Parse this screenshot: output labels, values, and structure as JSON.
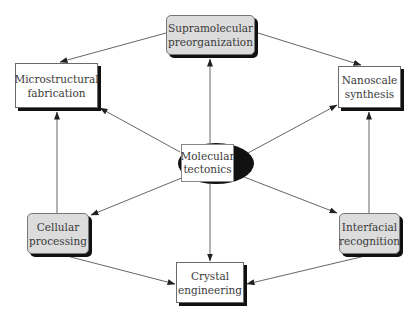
{
  "diagram": {
    "type": "concept-map",
    "center": {
      "id": "molecular-tectonics",
      "label": "Molecular\ntectonics",
      "style": "ellipse-black"
    },
    "nodes": [
      {
        "id": "supramolecular-preorganization",
        "label": "Supramolecular\npreorganization",
        "style": "shaded"
      },
      {
        "id": "microstructural-fabrication",
        "label": "Microstructural\nfabrication",
        "style": "plain"
      },
      {
        "id": "nanoscale-synthesis",
        "label": "Nanoscale\nsynthesis",
        "style": "plain"
      },
      {
        "id": "cellular-processing",
        "label": "Cellular\nprocessing",
        "style": "shaded"
      },
      {
        "id": "interfacial-recognition",
        "label": "Interfacial\nrecognition",
        "style": "shaded"
      },
      {
        "id": "crystal-engineering",
        "label": "Crystal\nengineering",
        "style": "plain"
      }
    ],
    "edges": [
      {
        "from": "molecular-tectonics",
        "to": "supramolecular-preorganization"
      },
      {
        "from": "molecular-tectonics",
        "to": "microstructural-fabrication"
      },
      {
        "from": "molecular-tectonics",
        "to": "nanoscale-synthesis"
      },
      {
        "from": "molecular-tectonics",
        "to": "cellular-processing"
      },
      {
        "from": "molecular-tectonics",
        "to": "interfacial-recognition"
      },
      {
        "from": "molecular-tectonics",
        "to": "crystal-engineering"
      },
      {
        "from": "supramolecular-preorganization",
        "to": "microstructural-fabrication"
      },
      {
        "from": "supramolecular-preorganization",
        "to": "nanoscale-synthesis"
      },
      {
        "from": "cellular-processing",
        "to": "microstructural-fabrication"
      },
      {
        "from": "interfacial-recognition",
        "to": "nanoscale-synthesis"
      },
      {
        "from": "cellular-processing",
        "to": "crystal-engineering"
      },
      {
        "from": "interfacial-recognition",
        "to": "crystal-engineering"
      }
    ],
    "colors": {
      "line": "#555555",
      "shaded_fill": "#dcdcdc",
      "shadow": "#111111",
      "center_fill": "#111111",
      "text": "#3a3a3a"
    }
  }
}
